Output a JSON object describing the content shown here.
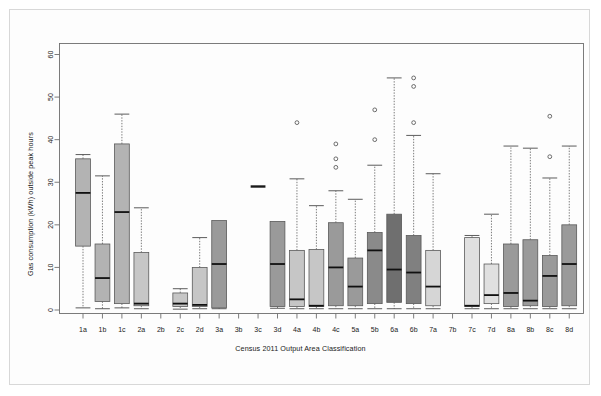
{
  "figure": {
    "background": "#ffffff",
    "border_color": "#d8d8d8"
  },
  "chart_data": {
    "type": "boxplot",
    "title": "",
    "xlabel": "Census 2011 Output Area Classification",
    "ylabel": "Gas consumption (kWh) outside peak hours",
    "ylim": [
      0,
      60
    ],
    "yticks": [
      0,
      10,
      20,
      30,
      40,
      50,
      60
    ],
    "ytick_labels": [
      "0",
      "10",
      "20",
      "30",
      "40",
      "50",
      "60"
    ],
    "grid": false,
    "legend": null,
    "categories": [
      "1a",
      "1b",
      "1c",
      "2a",
      "2b",
      "2c",
      "2d",
      "3a",
      "3b",
      "3c",
      "3d",
      "4a",
      "4b",
      "4c",
      "5a",
      "5b",
      "6a",
      "6b",
      "7a",
      "7b",
      "7c",
      "7d",
      "8a",
      "8b",
      "8c",
      "8d"
    ],
    "boxes": [
      {
        "category": "1a",
        "whisker_low": 0.5,
        "q1": 15.0,
        "median": 27.5,
        "q3": 35.5,
        "whisker_high": 36.5,
        "outliers": [],
        "fill": "#b3b3b3"
      },
      {
        "category": "1b",
        "whisker_low": 0.3,
        "q1": 2.0,
        "median": 7.5,
        "q3": 15.5,
        "whisker_high": 31.5,
        "outliers": [],
        "fill": "#b3b3b3"
      },
      {
        "category": "1c",
        "whisker_low": 0.5,
        "q1": 1.5,
        "median": 23.0,
        "q3": 39.0,
        "whisker_high": 46.0,
        "outliers": [],
        "fill": "#b3b3b3"
      },
      {
        "category": "2a",
        "whisker_low": 0.3,
        "q1": 1.0,
        "median": 1.5,
        "q3": 13.5,
        "whisker_high": 24.0,
        "outliers": [],
        "fill": "#c6c6c6"
      },
      {
        "category": "2b",
        "whisker_low": null,
        "q1": null,
        "median": null,
        "q3": null,
        "whisker_high": null,
        "outliers": [],
        "fill": "#c6c6c6"
      },
      {
        "category": "2c",
        "whisker_low": 0.2,
        "q1": 0.8,
        "median": 1.5,
        "q3": 4.0,
        "whisker_high": 5.0,
        "outliers": [],
        "fill": "#c6c6c6"
      },
      {
        "category": "2d",
        "whisker_low": 0.3,
        "q1": 0.8,
        "median": 1.2,
        "q3": 10.0,
        "whisker_high": 17.0,
        "outliers": [],
        "fill": "#c6c6c6"
      },
      {
        "category": "3a",
        "whisker_low": 0.3,
        "q1": 0.5,
        "median": 10.8,
        "q3": 21.0,
        "whisker_high": 21.0,
        "outliers": [],
        "fill": "#9a9a9a"
      },
      {
        "category": "3b",
        "whisker_low": null,
        "q1": null,
        "median": null,
        "q3": null,
        "whisker_high": null,
        "outliers": [],
        "fill": "#9a9a9a"
      },
      {
        "category": "3c",
        "whisker_low": 29.0,
        "q1": 29.0,
        "median": 29.0,
        "q3": 29.0,
        "whisker_high": 29.0,
        "outliers": [],
        "fill": "#9a9a9a"
      },
      {
        "category": "3d",
        "whisker_low": 0.4,
        "q1": 0.8,
        "median": 10.8,
        "q3": 20.8,
        "whisker_high": 20.8,
        "outliers": [],
        "fill": "#9a9a9a"
      },
      {
        "category": "4a",
        "whisker_low": 0.3,
        "q1": 0.8,
        "median": 2.5,
        "q3": 14.0,
        "whisker_high": 30.8,
        "outliers": [
          44.0
        ],
        "fill": "#c6c6c6"
      },
      {
        "category": "4b",
        "whisker_low": 0.3,
        "q1": 0.8,
        "median": 1.0,
        "q3": 14.2,
        "whisker_high": 24.5,
        "outliers": [],
        "fill": "#c6c6c6"
      },
      {
        "category": "4c",
        "whisker_low": 0.3,
        "q1": 1.0,
        "median": 10.0,
        "q3": 20.5,
        "whisker_high": 28.0,
        "outliers": [
          39.0,
          35.5,
          33.5
        ],
        "fill": "#9a9a9a"
      },
      {
        "category": "5a",
        "whisker_low": 0.3,
        "q1": 1.0,
        "median": 5.5,
        "q3": 12.2,
        "whisker_high": 26.0,
        "outliers": [],
        "fill": "#9a9a9a"
      },
      {
        "category": "5b",
        "whisker_low": 0.3,
        "q1": 1.5,
        "median": 14.0,
        "q3": 18.2,
        "whisker_high": 34.0,
        "outliers": [
          40.0,
          47.0
        ],
        "fill": "#8a8a8a"
      },
      {
        "category": "6a",
        "whisker_low": 0.3,
        "q1": 1.8,
        "median": 9.5,
        "q3": 22.5,
        "whisker_high": 54.5,
        "outliers": [],
        "fill": "#6f6f6f"
      },
      {
        "category": "6b",
        "whisker_low": 0.3,
        "q1": 1.5,
        "median": 8.8,
        "q3": 17.5,
        "whisker_high": 41.0,
        "outliers": [
          54.5,
          52.5,
          44.0
        ],
        "fill": "#808080"
      },
      {
        "category": "7a",
        "whisker_low": 0.3,
        "q1": 1.0,
        "median": 5.5,
        "q3": 14.0,
        "whisker_high": 32.0,
        "outliers": [],
        "fill": "#d6d6d6"
      },
      {
        "category": "7b",
        "whisker_low": null,
        "q1": null,
        "median": null,
        "q3": null,
        "whisker_high": null,
        "outliers": [],
        "fill": "#d6d6d6"
      },
      {
        "category": "7c",
        "whisker_low": 0.3,
        "q1": 0.8,
        "median": 1.0,
        "q3": 17.0,
        "whisker_high": 17.5,
        "outliers": [],
        "fill": "#e0e0e0"
      },
      {
        "category": "7d",
        "whisker_low": 0.3,
        "q1": 1.5,
        "median": 3.5,
        "q3": 10.8,
        "whisker_high": 22.5,
        "outliers": [],
        "fill": "#e0e0e0"
      },
      {
        "category": "8a",
        "whisker_low": 0.3,
        "q1": 0.8,
        "median": 4.0,
        "q3": 15.5,
        "whisker_high": 38.5,
        "outliers": [],
        "fill": "#9a9a9a"
      },
      {
        "category": "8b",
        "whisker_low": 0.3,
        "q1": 1.0,
        "median": 2.2,
        "q3": 16.5,
        "whisker_high": 38.0,
        "outliers": [],
        "fill": "#9a9a9a"
      },
      {
        "category": "8c",
        "whisker_low": 0.3,
        "q1": 0.8,
        "median": 8.0,
        "q3": 12.8,
        "whisker_high": 31.0,
        "outliers": [
          45.5,
          36.0
        ],
        "fill": "#9a9a9a"
      },
      {
        "category": "8d",
        "whisker_low": 0.3,
        "q1": 1.0,
        "median": 10.8,
        "q3": 20.0,
        "whisker_high": 38.5,
        "outliers": [],
        "fill": "#9a9a9a"
      }
    ]
  }
}
